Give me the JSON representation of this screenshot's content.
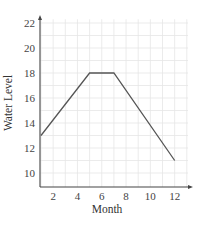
{
  "chart_data": {
    "type": "line",
    "title": "",
    "xlabel": "Month",
    "ylabel": "Water Level",
    "x": [
      1,
      5,
      7,
      12
    ],
    "series": [
      {
        "name": "Water Level",
        "values": [
          13,
          18,
          18,
          11
        ]
      }
    ],
    "x_ticks": [
      2,
      4,
      6,
      8,
      10,
      12
    ],
    "y_ticks": [
      10,
      12,
      14,
      16,
      18,
      20,
      22
    ],
    "xlim": [
      1,
      13.4
    ],
    "ylim": [
      9,
      22.3
    ],
    "grid": true,
    "legend": "none"
  },
  "colors": {
    "line": "#555555",
    "axis": "#444444",
    "grid": "#e6e6e6"
  }
}
